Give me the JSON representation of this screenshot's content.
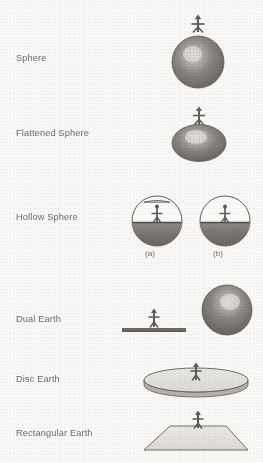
{
  "figure": {
    "palette": {
      "background": "#f9f8f6",
      "ink": "#6a6a6a",
      "line": "#5f5f5f",
      "body_dark": "#6e6e6e",
      "body_mid": "#8a8a8a",
      "highlight": "#d8d6d2",
      "fill_light": "#e9e8e4"
    },
    "rows": [
      {
        "id": "sphere",
        "label": "Sphere",
        "label_x": 16,
        "label_y": 53,
        "shape": "sphere",
        "figure_x": 160,
        "figure_y": 10,
        "figure_w": 75,
        "figure_h": 78
      },
      {
        "id": "flattened-sphere",
        "label": "Flattened Sphere",
        "label_x": 16,
        "label_y": 128,
        "shape": "flattened-sphere",
        "figure_x": 163,
        "figure_y": 104,
        "figure_w": 72,
        "figure_h": 60
      },
      {
        "id": "hollow-sphere",
        "label": "Hollow Sphere",
        "label_x": 16,
        "label_y": 212,
        "shape": "hollow-sphere",
        "figure_x": 128,
        "figure_y": 192,
        "figure_w": 128,
        "figure_h": 70,
        "variants": [
          {
            "id": "a",
            "caption": "(a)",
            "open_top": true,
            "x": 128,
            "cap_x": 135,
            "cap_y": 249
          },
          {
            "id": "b",
            "caption": "(b)",
            "open_top": false,
            "x": 196,
            "cap_x": 203,
            "cap_y": 249
          }
        ]
      },
      {
        "id": "dual-earth",
        "label": "Dual Earth",
        "label_x": 16,
        "label_y": 314,
        "shape": "dual-earth",
        "figure_x": 120,
        "figure_y": 283,
        "figure_w": 135,
        "figure_h": 62
      },
      {
        "id": "disc-earth",
        "label": "Disc Earth",
        "label_x": 16,
        "label_y": 374,
        "shape": "disc-earth",
        "figure_x": 140,
        "figure_y": 362,
        "figure_w": 112,
        "figure_h": 40
      },
      {
        "id": "rectangular-earth",
        "label": "Rectangular Earth",
        "label_x": 16,
        "label_y": 428,
        "shape": "rectangular-earth",
        "figure_x": 140,
        "figure_y": 412,
        "figure_w": 112,
        "figure_h": 46
      }
    ]
  }
}
